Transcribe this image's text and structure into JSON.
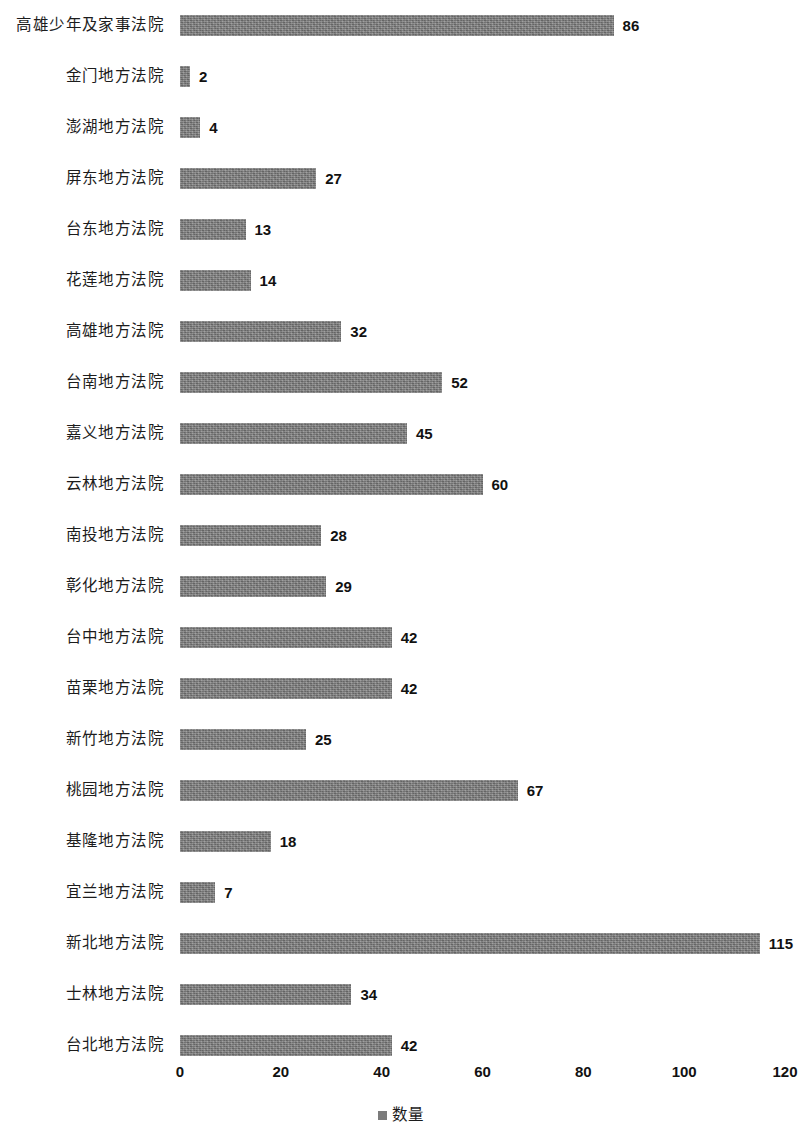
{
  "chart_data": {
    "type": "bar",
    "orientation": "horizontal",
    "title": "",
    "subtitle": "",
    "xlabel": "",
    "ylabel": "",
    "xlim": [
      0,
      120
    ],
    "xticks": [
      "0",
      "20",
      "40",
      "60",
      "80",
      "100",
      "120"
    ],
    "grid": false,
    "legend_position": "bottom",
    "legend": [
      "数量"
    ],
    "bar_color": "#7b7b7b",
    "series": [
      {
        "name": "数量",
        "values": [
          86,
          2,
          4,
          27,
          13,
          14,
          32,
          52,
          45,
          60,
          28,
          29,
          42,
          42,
          25,
          67,
          18,
          7,
          115,
          34,
          42
        ]
      }
    ],
    "categories": [
      "高雄少年及家事法院",
      "金门地方法院",
      "澎湖地方法院",
      "屏东地方法院",
      "台东地方法院",
      "花莲地方法院",
      "高雄地方法院",
      "台南地方法院",
      "嘉义地方法院",
      "云林地方法院",
      "南投地方法院",
      "彰化地方法院",
      "台中地方法院",
      "苗栗地方法院",
      "新竹地方法院",
      "桃园地方法院",
      "基隆地方法院",
      "宜兰地方法院",
      "新北地方法院",
      "士林地方法院",
      "台北地方法院"
    ],
    "data_labels": [
      "86",
      "2",
      "4",
      "27",
      "13",
      "14",
      "32",
      "52",
      "45",
      "60",
      "28",
      "29",
      "42",
      "42",
      "25",
      "67",
      "18",
      "7",
      "115",
      "34",
      "42"
    ]
  }
}
